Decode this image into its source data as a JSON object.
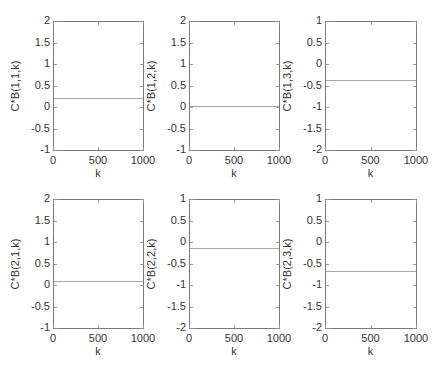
{
  "chart_data": [
    {
      "type": "line",
      "title": "",
      "xlabel": "k",
      "ylabel": "C*B(1,1,k)",
      "xlim": [
        0,
        1000
      ],
      "ylim": [
        -1,
        2
      ],
      "xticks": [
        "0",
        "500",
        "1000"
      ],
      "yticks": [
        "2",
        "1.5",
        "1",
        "0.5",
        "0",
        "-0.5",
        "-1"
      ],
      "x": [
        0,
        1000
      ],
      "values": [
        0.21,
        0.21
      ],
      "grid": false
    },
    {
      "type": "line",
      "title": "",
      "xlabel": "k",
      "ylabel": "C*B(1,2,k)",
      "xlim": [
        0,
        1000
      ],
      "ylim": [
        -1,
        2
      ],
      "xticks": [
        "0",
        "500",
        "1000"
      ],
      "yticks": [
        "2",
        "1.5",
        "1",
        "0.5",
        "0",
        "-0.5",
        "-1"
      ],
      "x": [
        0,
        1000
      ],
      "values": [
        0.02,
        0.02
      ],
      "grid": false
    },
    {
      "type": "line",
      "title": "",
      "xlabel": "k",
      "ylabel": "C*B(1,3,k)",
      "xlim": [
        0,
        1000
      ],
      "ylim": [
        -2,
        1
      ],
      "xticks": [
        "0",
        "500",
        "1000"
      ],
      "yticks": [
        "1",
        "0.5",
        "0",
        "-0.5",
        "-1",
        "-1.5",
        "-2"
      ],
      "x": [
        0,
        1000
      ],
      "values": [
        -0.38,
        -0.38
      ],
      "grid": false
    },
    {
      "type": "line",
      "title": "",
      "xlabel": "k",
      "ylabel": "C*B(2,1,k)",
      "xlim": [
        0,
        1000
      ],
      "ylim": [
        -1,
        2
      ],
      "xticks": [
        "0",
        "500",
        "1000"
      ],
      "yticks": [
        "2",
        "1.5",
        "1",
        "0.5",
        "0",
        "-0.5",
        "-1"
      ],
      "x": [
        0,
        1000
      ],
      "values": [
        0.09,
        0.09
      ],
      "grid": false
    },
    {
      "type": "line",
      "title": "",
      "xlabel": "k",
      "ylabel": "C*B(2,2,k)",
      "xlim": [
        0,
        1000
      ],
      "ylim": [
        -2,
        1
      ],
      "xticks": [
        "0",
        "500",
        "1000"
      ],
      "yticks": [
        "1",
        "0.5",
        "0",
        "-0.5",
        "-1",
        "-1.5",
        "-2"
      ],
      "x": [
        0,
        1000
      ],
      "values": [
        -0.14,
        -0.14
      ],
      "grid": false
    },
    {
      "type": "line",
      "title": "",
      "xlabel": "k",
      "ylabel": "C*B(2,3,k)",
      "xlim": [
        0,
        1000
      ],
      "ylim": [
        -2,
        1
      ],
      "xticks": [
        "0",
        "500",
        "1000"
      ],
      "yticks": [
        "1",
        "0.5",
        "0",
        "-0.5",
        "-1",
        "-1.5",
        "-2"
      ],
      "x": [
        0,
        1000
      ],
      "values": [
        -0.67,
        -0.67
      ],
      "grid": false
    }
  ],
  "layout": {
    "cols_left": [
      53,
      189,
      325
    ],
    "cols_right": [
      143,
      279,
      416
    ],
    "rows_top": [
      21,
      199
    ],
    "rows_bottom": [
      150,
      328
    ],
    "line_color": "#a8a8a8",
    "axis_color": "#7a7a7a"
  }
}
